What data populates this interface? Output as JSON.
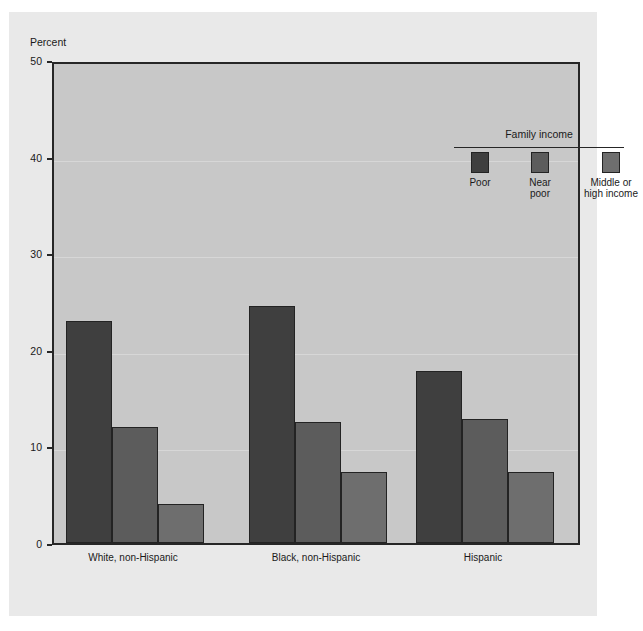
{
  "figure": {
    "cropped_header_text": "",
    "background_color": "#e9e9e9",
    "plot_background_color": "#c8c8c8",
    "frame_color": "#262626"
  },
  "chart_data": {
    "type": "bar",
    "title": "",
    "xlabel": "",
    "ylabel": "Percent",
    "ylim": [
      0,
      50
    ],
    "yticks": [
      0,
      10,
      20,
      30,
      40,
      50
    ],
    "ytick_labels": [
      "0",
      "10",
      "20",
      "30",
      "40",
      "50"
    ],
    "grid": false,
    "legend_title": "Family income",
    "legend_position": "top-right-inside",
    "categories": [
      "White, non-Hispanic",
      "Black, non-Hispanic",
      "Hispanic"
    ],
    "series": [
      {
        "name": "Poor",
        "label_lines": [
          "Poor"
        ],
        "color": "#3f3f3f",
        "values": [
          23.0,
          24.5,
          17.8
        ]
      },
      {
        "name": "Near poor",
        "label_lines": [
          "Near",
          "poor"
        ],
        "color": "#5c5c5c",
        "values": [
          12.0,
          12.5,
          12.8
        ]
      },
      {
        "name": "Middle or high income",
        "label_lines": [
          "Middle or",
          "high income"
        ],
        "color": "#6e6e6e",
        "values": [
          4.0,
          7.4,
          7.3
        ]
      }
    ]
  }
}
